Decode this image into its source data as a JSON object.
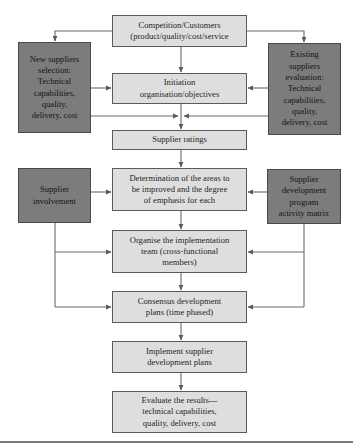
{
  "diagram": {
    "type": "flowchart",
    "colors": {
      "main_box_fill": "#dedede",
      "side_box_fill": "#7c7c7c",
      "line": "#5a5a5a"
    },
    "nodes": {
      "competition": {
        "label": "Competition/Customers\n(product/quality/cost/service"
      },
      "new_suppliers": {
        "label": "New suppliers\nselection:\nTechnical\ncapabilities,\nquality,\ndelivery, cost"
      },
      "existing_suppliers": {
        "label": "Existing\nsuppliers\nevaluation:\nTechnical\ncapabilities,\nquality,\ndelivery, cost"
      },
      "initiation": {
        "label": "Initiation\norganisation/objectives"
      },
      "supplier_ratings": {
        "label": "Supplier ratings"
      },
      "determination": {
        "label": "Determination of the areas to\nbe improved and the degree\nof emphasis for each"
      },
      "supplier_involvement": {
        "label": "Supplier\ninvolvement"
      },
      "dev_program_matrix": {
        "label": "Supplier\ndevelopment\nprogram\nactivity matrix"
      },
      "organise_team": {
        "label": "Organise the implementation\nteam (cross-functional\nmembers)"
      },
      "consensus_plans": {
        "label": "Consensus development\nplans (time phased)"
      },
      "implement_plans": {
        "label": "Implement supplier\ndevelopment plans"
      },
      "evaluate_results": {
        "label": "Evaluate the results—\ntechnical capabilities,\nquality, delivery, cost"
      }
    },
    "edges": [
      [
        "competition",
        "new_suppliers"
      ],
      [
        "competition",
        "existing_suppliers"
      ],
      [
        "competition",
        "initiation"
      ],
      [
        "new_suppliers",
        "initiation"
      ],
      [
        "existing_suppliers",
        "initiation"
      ],
      [
        "initiation",
        "supplier_ratings"
      ],
      [
        "new_suppliers",
        "supplier_ratings"
      ],
      [
        "existing_suppliers",
        "supplier_ratings"
      ],
      [
        "supplier_ratings",
        "determination"
      ],
      [
        "supplier_involvement",
        "determination"
      ],
      [
        "dev_program_matrix",
        "determination"
      ],
      [
        "determination",
        "organise_team"
      ],
      [
        "supplier_involvement",
        "organise_team"
      ],
      [
        "dev_program_matrix",
        "organise_team"
      ],
      [
        "organise_team",
        "consensus_plans"
      ],
      [
        "supplier_involvement",
        "consensus_plans"
      ],
      [
        "dev_program_matrix",
        "consensus_plans"
      ],
      [
        "consensus_plans",
        "implement_plans"
      ],
      [
        "implement_plans",
        "evaluate_results"
      ]
    ]
  }
}
